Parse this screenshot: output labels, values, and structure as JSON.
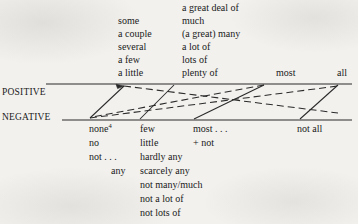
{
  "diagram": {
    "type": "square-of-opposition-quantifier-scale",
    "axis_labels": {
      "positive": "POSITIVE",
      "negative": "NEGATIVE"
    },
    "positive_scale": {
      "weak_column": [
        "some",
        "a couple",
        "several",
        "a few",
        "a little"
      ],
      "mid_column": [
        "a great deal of",
        "much",
        "(a great) many",
        "a lot of",
        "lots of",
        "plenty of"
      ],
      "most": "most",
      "all": "all"
    },
    "negative_scale": {
      "none_column": [
        "none",
        "no",
        "not . . .",
        "any"
      ],
      "none_footnote_marker": "4",
      "few_column": [
        "few",
        "little",
        "hardly any",
        "scarcely any",
        "not many/much",
        "not a lot of",
        "not lots of"
      ],
      "most_not_column": [
        "most . . .",
        "+ not"
      ],
      "not_all": "not all"
    },
    "colors": {
      "ink": "#1f1f1f",
      "paper": "#f2f1ee"
    }
  }
}
